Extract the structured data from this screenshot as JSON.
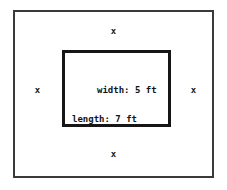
{
  "diagram": {
    "type": "nested-rectangles-border-problem",
    "outer_rect": {
      "name": "outer-boundary"
    },
    "inner_rect": {
      "name": "inner-region",
      "labels": {
        "width": "width: 5 ft",
        "length": "length: 7 ft"
      },
      "width_value": 5,
      "length_value": 7,
      "units": "ft"
    },
    "border_markers": {
      "symbol": "x",
      "top": "x",
      "right": "x",
      "bottom": "x",
      "left": "x"
    },
    "colors": {
      "background": "#ffffff",
      "outer_stroke": "#3a3a3a",
      "inner_stroke": "#161616",
      "text": "#141414"
    }
  }
}
